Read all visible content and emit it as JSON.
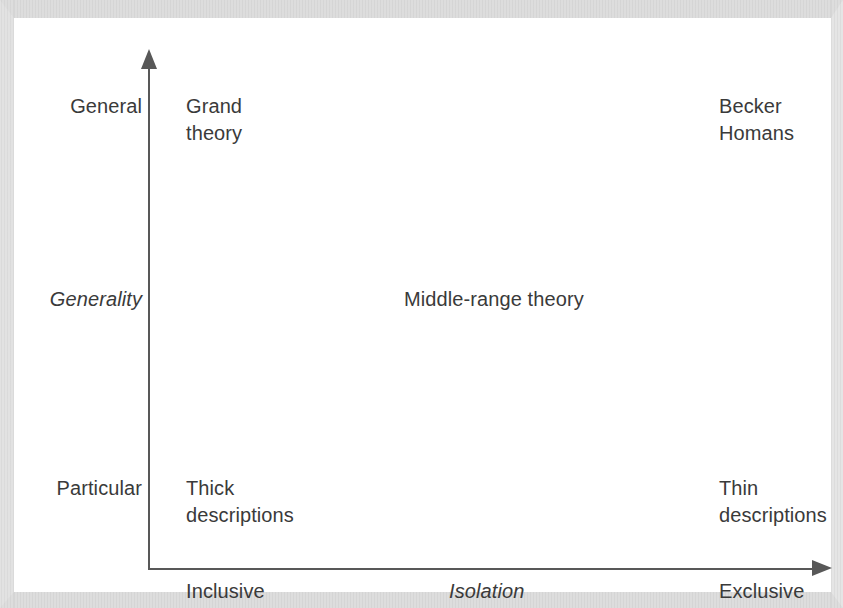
{
  "figure": {
    "type": "quadrant-diagram",
    "axes": {
      "y": {
        "name": "Generality",
        "top_label": "General",
        "bottom_label": "Particular",
        "direction": "upward-arrow"
      },
      "x": {
        "name": "Isolation",
        "left_label": "Inclusive",
        "right_label": "Exclusive",
        "direction": "rightward-arrow"
      }
    },
    "items": [
      {
        "id": "top-left",
        "text": "Grand\ntheory",
        "quadrant": "general / inclusive"
      },
      {
        "id": "top-right",
        "text": "Becker\nHomans",
        "quadrant": "general / exclusive"
      },
      {
        "id": "center",
        "text": "Middle-range theory",
        "quadrant": "center"
      },
      {
        "id": "bottom-left",
        "text": "Thick\ndescriptions",
        "quadrant": "particular / inclusive"
      },
      {
        "id": "bottom-right",
        "text": "Thin\ndescriptions",
        "quadrant": "particular / exclusive"
      }
    ],
    "colors": {
      "axis": "#585858",
      "text": "#3a3a3a",
      "background": "#ffffff",
      "scan_border": "#ededed"
    }
  },
  "chart_data": {
    "type": "scatter",
    "title": "",
    "xlabel": "Isolation",
    "ylabel": "Generality",
    "x_tick_labels": [
      "Inclusive",
      "Exclusive"
    ],
    "y_tick_labels": [
      "Particular",
      "General"
    ],
    "grid": false,
    "legend": "none",
    "annotations": [
      {
        "label": "Grand theory",
        "x": "Inclusive",
        "y": "General"
      },
      {
        "label": "Becker\nHomans",
        "x": "Exclusive",
        "y": "General"
      },
      {
        "label": "Middle-range theory",
        "x": "Middle",
        "y": "Middle"
      },
      {
        "label": "Thick descriptions",
        "x": "Inclusive",
        "y": "Particular"
      },
      {
        "label": "Thin descriptions",
        "x": "Exclusive",
        "y": "Particular"
      }
    ]
  }
}
